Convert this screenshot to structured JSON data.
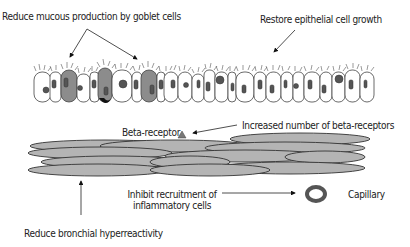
{
  "diagram": {
    "labels": {
      "goblet": "Reduce mucous production by goblet cells",
      "epithelial": "Restore epithelial cell growth",
      "beta_receptor": "Beta-receptor",
      "increased_beta": "Increased number of beta-receptors",
      "inhibit_line1": "Inhibit recruitment of",
      "inhibit_line2": "inflammatory cells",
      "capillary": "Capillary",
      "bronchial": "Reduce bronchial hyperreactivity"
    },
    "colors": {
      "goblet_cell": "#8c8c8c",
      "muscle_cell": "#b4b4b4",
      "outline": "#333333",
      "nucleus": "#555555",
      "capillary": "#555555"
    },
    "structures": {
      "epithelium": "ciliated epithelial cell layer with goblet cells",
      "smooth_muscle": "smooth muscle cell layer",
      "capillary": "capillary cross-section"
    }
  }
}
